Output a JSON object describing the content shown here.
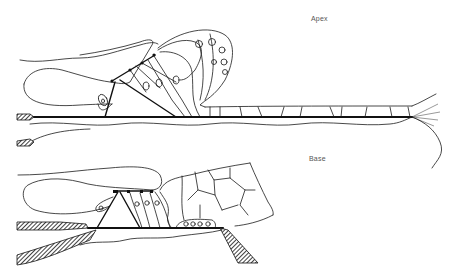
{
  "figure": {
    "panels": [
      {
        "id": "apex",
        "label": "Apex"
      },
      {
        "id": "base",
        "label": "Base"
      }
    ],
    "colors": {
      "ink": "#111111",
      "background": "#ffffff",
      "label": "#555555"
    }
  }
}
